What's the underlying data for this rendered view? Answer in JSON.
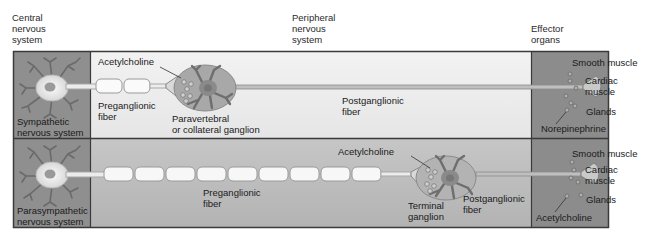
{
  "headers": {
    "cns": [
      "Central",
      "nervous",
      "system"
    ],
    "pns": [
      "Peripheral",
      "nervous",
      "system"
    ],
    "effector": [
      "Effector",
      "organs"
    ]
  },
  "sympathetic": {
    "system_label": [
      "Sympathetic",
      "nervous system"
    ],
    "neurotransmitter_top": "Acetylcholine",
    "preganglionic": [
      "Preganglionic",
      "fiber"
    ],
    "ganglion": [
      "Paravertebral",
      "or collateral ganglion"
    ],
    "postganglionic": [
      "Postganglionic",
      "fiber"
    ],
    "effectors": {
      "smooth_muscle": "Smooth muscle",
      "cardiac": [
        "Cardiac",
        "muscle"
      ],
      "glands": "Glands"
    },
    "neurotransmitter_effector": "Norepinephrine"
  },
  "parasympathetic": {
    "system_label": [
      "Parasympathetic",
      "nervous system"
    ],
    "neurotransmitter_top": "Acetylcholine",
    "preganglionic": [
      "Preganglionic",
      "fiber"
    ],
    "ganglion": [
      "Terminal",
      "ganglion"
    ],
    "postganglionic": [
      "Postganglionic",
      "fiber"
    ],
    "effectors": {
      "smooth_muscle": "Smooth muscle",
      "cardiac": [
        "Cardiac",
        "muscle"
      ],
      "glands": "Glands"
    },
    "neurotransmitter_effector": "Acetylcholine"
  },
  "colors": {
    "cns_panel": "#8f8f8f",
    "effector_panel": "#8c8c8c",
    "symp_middle": "#ececec",
    "para_middle": "#b9b9b9",
    "border": "#3a3a3a",
    "ganglion_fill": "#a8a8a8"
  }
}
